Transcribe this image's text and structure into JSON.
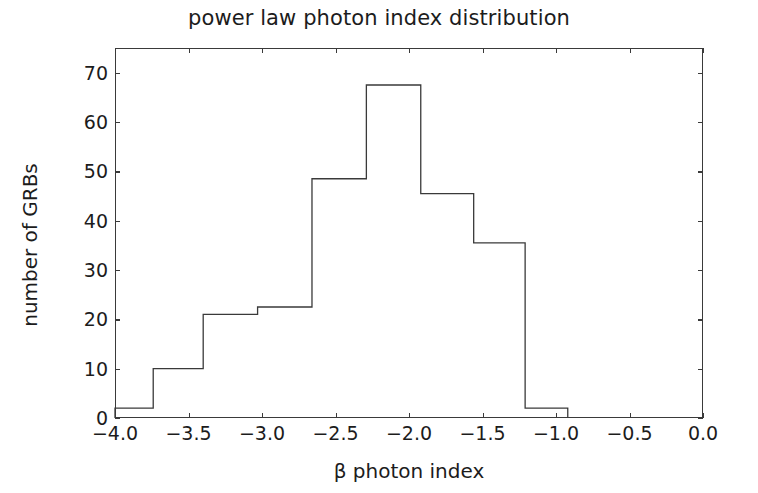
{
  "chart_data": {
    "type": "bar",
    "subtype": "histogram-step-outline",
    "title": "power law photon index distribution",
    "xlabel": "β photon index",
    "ylabel": "number of GRBs",
    "xlim": [
      -4.0,
      0.0
    ],
    "ylim": [
      0,
      75
    ],
    "grid": false,
    "legend": null,
    "xticks": [
      -4.0,
      -3.5,
      -3.0,
      -2.5,
      -2.0,
      -1.5,
      -1.0,
      -0.5,
      0.0
    ],
    "xtick_labels": [
      "−4.0",
      "−3.5",
      "−3.0",
      "−2.5",
      "−2.0",
      "−1.5",
      "−1.0",
      "−0.5",
      "0.0"
    ],
    "yticks": [
      0,
      10,
      20,
      30,
      40,
      50,
      60,
      70
    ],
    "ytick_labels": [
      "0",
      "10",
      "20",
      "30",
      "40",
      "50",
      "60",
      "70"
    ],
    "bin_edges": [
      -4.0,
      -3.74,
      -3.4,
      -3.03,
      -2.66,
      -2.29,
      -1.92,
      -1.56,
      -1.21,
      -0.92
    ],
    "values": [
      2,
      10,
      21,
      22.5,
      48.5,
      67.5,
      45.5,
      35.5,
      2
    ],
    "bin_centers": [
      -3.87,
      -3.57,
      -3.215,
      -2.845,
      -2.475,
      -2.105,
      -1.74,
      -1.385,
      -1.065
    ],
    "line_color": "#3a3a3a",
    "fill_color": "none",
    "axis_color": "#3a3a3a",
    "background_color": "#ffffff"
  },
  "figure": {
    "title": "power law photon index distribution"
  }
}
